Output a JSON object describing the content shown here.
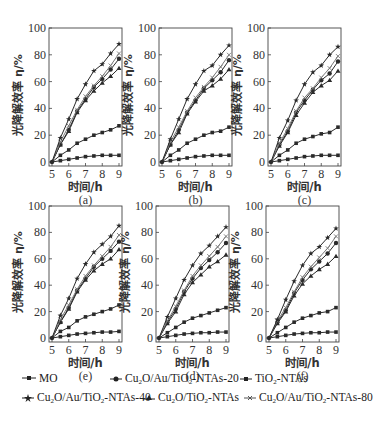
{
  "chart_data": [
    {
      "type": "line",
      "panel_label": "(a)",
      "xlabel": "时间/h",
      "ylabel": "光降解效率 η/%",
      "xlim": [
        5,
        9
      ],
      "ylim": [
        0,
        100
      ],
      "xticks": [
        5,
        6,
        7,
        8,
        9
      ],
      "yticks": [
        0,
        20,
        40,
        60,
        80,
        100
      ],
      "x": [
        5,
        5.5,
        6,
        6.5,
        7,
        7.5,
        8,
        8.5,
        9
      ],
      "series": [
        {
          "name": "MO",
          "values": [
            0,
            1,
            2,
            3,
            4,
            4.5,
            5,
            5,
            5
          ]
        },
        {
          "name": "TiO2-NTAs",
          "values": [
            0,
            5,
            9,
            14,
            17,
            20,
            22,
            24,
            27
          ]
        },
        {
          "name": "Cu2O/TiO2-NTAs",
          "values": [
            0,
            13,
            23,
            37,
            46,
            53,
            59,
            64,
            70
          ]
        },
        {
          "name": "Cu2O/Au/TiO2-NTAs-20",
          "values": [
            0,
            13,
            24,
            38,
            47,
            56,
            62,
            69,
            77
          ]
        },
        {
          "name": "Cu2O/Au/TiO2-NTAs-80",
          "values": [
            0,
            15,
            27,
            39,
            49,
            57,
            64,
            72,
            81
          ]
        },
        {
          "name": "Cu2O/Au/TiO2-NTAs-40",
          "values": [
            0,
            18,
            32,
            47,
            58,
            68,
            73,
            81,
            88
          ]
        }
      ]
    },
    {
      "type": "line",
      "panel_label": "(b)",
      "xlabel": "时间/h",
      "ylabel": "光降解效率 η/%",
      "xlim": [
        5,
        9
      ],
      "ylim": [
        0,
        100
      ],
      "xticks": [
        5,
        6,
        7,
        8,
        9
      ],
      "yticks": [
        0,
        20,
        40,
        60,
        80,
        100
      ],
      "x": [
        5,
        5.5,
        6,
        6.5,
        7,
        7.5,
        8,
        8.5,
        9
      ],
      "series": [
        {
          "name": "MO",
          "values": [
            0,
            1,
            2,
            3,
            4,
            4.5,
            5,
            5,
            5
          ]
        },
        {
          "name": "TiO2-NTAs",
          "values": [
            0,
            5,
            9,
            14,
            17,
            20,
            22,
            23,
            26
          ]
        },
        {
          "name": "Cu2O/TiO2-NTAs",
          "values": [
            0,
            13,
            22,
            36,
            45,
            53,
            57,
            62,
            69
          ]
        },
        {
          "name": "Cu2O/Au/TiO2-NTAs-20",
          "values": [
            0,
            13,
            24,
            37,
            46,
            55,
            61,
            67,
            76
          ]
        },
        {
          "name": "Cu2O/Au/TiO2-NTAs-80",
          "values": [
            0,
            15,
            26,
            38,
            48,
            56,
            63,
            71,
            80
          ]
        },
        {
          "name": "Cu2O/Au/TiO2-NTAs-40",
          "values": [
            0,
            17,
            32,
            47,
            58,
            68,
            72,
            80,
            87
          ]
        }
      ]
    },
    {
      "type": "line",
      "panel_label": "(c)",
      "xlabel": "时间/h",
      "ylabel": "光降解效率 η/%",
      "xlim": [
        5,
        9
      ],
      "ylim": [
        0,
        100
      ],
      "xticks": [
        5,
        6,
        7,
        8,
        9
      ],
      "yticks": [
        0,
        20,
        40,
        60,
        80,
        100
      ],
      "x": [
        5,
        5.5,
        6,
        6.5,
        7,
        7.5,
        8,
        8.5,
        9
      ],
      "series": [
        {
          "name": "MO",
          "values": [
            0,
            1,
            2,
            3,
            4,
            4.5,
            5,
            5,
            5
          ]
        },
        {
          "name": "TiO2-NTAs",
          "values": [
            0,
            5,
            9,
            14,
            17,
            19,
            21,
            22,
            26
          ]
        },
        {
          "name": "Cu2O/TiO2-NTAs",
          "values": [
            0,
            12,
            22,
            35,
            44,
            52,
            57,
            61,
            68
          ]
        },
        {
          "name": "Cu2O/Au/TiO2-NTAs-20",
          "values": [
            0,
            13,
            23,
            37,
            46,
            54,
            61,
            66,
            75
          ]
        },
        {
          "name": "Cu2O/Au/TiO2-NTAs-80",
          "values": [
            0,
            14,
            25,
            38,
            48,
            55,
            63,
            70,
            79
          ]
        },
        {
          "name": "Cu2O/Au/TiO2-NTAs-40",
          "values": [
            0,
            18,
            31,
            46,
            58,
            67,
            72,
            80,
            86
          ]
        }
      ]
    },
    {
      "type": "line",
      "panel_label": "(e)",
      "xlabel": "时间/h",
      "ylabel": "光降解效率 η/%",
      "xlim": [
        5,
        9
      ],
      "ylim": [
        0,
        100
      ],
      "xticks": [
        5,
        6,
        7,
        8,
        9
      ],
      "yticks": [
        0,
        20,
        40,
        60,
        80,
        100
      ],
      "x": [
        5,
        5.5,
        6,
        6.5,
        7,
        7.5,
        8,
        8.5,
        9
      ],
      "series": [
        {
          "name": "MO",
          "values": [
            0,
            1,
            2,
            3,
            3.5,
            4,
            4.5,
            4.5,
            5
          ]
        },
        {
          "name": "TiO2-NTAs",
          "values": [
            0,
            5,
            8,
            13,
            16,
            18,
            20,
            22,
            25
          ]
        },
        {
          "name": "Cu2O/TiO2-NTAs",
          "values": [
            0,
            12,
            22,
            35,
            44,
            51,
            56,
            60,
            67
          ]
        },
        {
          "name": "Cu2O/Au/TiO2-NTAs-20",
          "values": [
            0,
            12,
            23,
            36,
            45,
            54,
            60,
            66,
            73
          ]
        },
        {
          "name": "Cu2O/Au/TiO2-NTAs-80",
          "values": [
            0,
            14,
            25,
            37,
            47,
            55,
            62,
            69,
            78
          ]
        },
        {
          "name": "Cu2O/Au/TiO2-NTAs-40",
          "values": [
            0,
            17,
            30,
            45,
            56,
            65,
            71,
            77,
            85
          ]
        }
      ]
    },
    {
      "type": "line",
      "panel_label": "(d)",
      "xlabel": "时间/h",
      "ylabel": "光降解效率 η/%",
      "xlim": [
        5,
        9
      ],
      "ylim": [
        0,
        100
      ],
      "xticks": [
        5,
        6,
        7,
        8,
        9
      ],
      "yticks": [
        0,
        20,
        40,
        60,
        80,
        100
      ],
      "x": [
        5,
        5.5,
        6,
        6.5,
        7,
        7.5,
        8,
        8.5,
        9
      ],
      "series": [
        {
          "name": "MO",
          "values": [
            0,
            1,
            2,
            3,
            3.5,
            4,
            4,
            4.5,
            4.5
          ]
        },
        {
          "name": "TiO2-NTAs",
          "values": [
            0,
            4,
            8,
            12,
            15,
            17,
            19,
            21,
            23
          ]
        },
        {
          "name": "Cu2O/TiO2-NTAs",
          "values": [
            0,
            11,
            20,
            33,
            42,
            48,
            54,
            58,
            63
          ]
        },
        {
          "name": "Cu2O/Au/TiO2-NTAs-20",
          "values": [
            0,
            12,
            22,
            35,
            45,
            53,
            59,
            65,
            72
          ]
        },
        {
          "name": "Cu2O/Au/TiO2-NTAs-80",
          "values": [
            0,
            13,
            24,
            36,
            47,
            55,
            62,
            69,
            77
          ]
        },
        {
          "name": "Cu2O/Au/TiO2-NTAs-40",
          "values": [
            0,
            16,
            30,
            44,
            55,
            64,
            70,
            77,
            84
          ]
        }
      ]
    },
    {
      "type": "line",
      "panel_label": "(f)",
      "xlabel": "时间/h",
      "ylabel": "光降解效率 η/%",
      "xlim": [
        5,
        9
      ],
      "ylim": [
        0,
        100
      ],
      "xticks": [
        5,
        6,
        7,
        8,
        9
      ],
      "yticks": [
        0,
        20,
        40,
        60,
        80,
        100
      ],
      "x": [
        5,
        5.5,
        6,
        6.5,
        7,
        7.5,
        8,
        8.5,
        9
      ],
      "series": [
        {
          "name": "MO",
          "values": [
            0,
            1,
            2,
            3,
            3.5,
            4,
            4,
            4.5,
            4.5
          ]
        },
        {
          "name": "TiO2-NTAs",
          "values": [
            0,
            4,
            8,
            12,
            15,
            17,
            19,
            20,
            23
          ]
        },
        {
          "name": "Cu2O/TiO2-NTAs",
          "values": [
            0,
            11,
            20,
            32,
            41,
            47,
            52,
            56,
            62
          ]
        },
        {
          "name": "Cu2O/Au/TiO2-NTAs-20",
          "values": [
            0,
            12,
            21,
            34,
            44,
            52,
            58,
            64,
            72
          ]
        },
        {
          "name": "Cu2O/Au/TiO2-NTAs-80",
          "values": [
            0,
            13,
            23,
            35,
            46,
            54,
            61,
            68,
            77
          ]
        },
        {
          "name": "Cu2O/Au/TiO2-NTAs-40",
          "values": [
            0,
            14,
            29,
            43,
            55,
            64,
            69,
            76,
            83
          ]
        }
      ]
    }
  ],
  "panels": [
    {
      "label": "(a)",
      "x0": 49,
      "y0": 28,
      "w": 73,
      "h": 134
    },
    {
      "label": "(b)",
      "x0": 159,
      "y0": 28,
      "w": 73,
      "h": 134
    },
    {
      "label": "(c)",
      "x0": 268,
      "y0": 28,
      "w": 73,
      "h": 134
    },
    {
      "label": "(e)",
      "x0": 49,
      "y0": 206,
      "w": 73,
      "h": 132
    },
    {
      "label": "(d)",
      "x0": 156,
      "y0": 206,
      "w": 73,
      "h": 132
    },
    {
      "label": "(f)",
      "x0": 266,
      "y0": 206,
      "w": 73,
      "h": 132
    }
  ],
  "axis": {
    "xlabel": "时间/h",
    "ylabel": "光降解效率 η/%"
  },
  "legend": {
    "items": [
      {
        "key": "MO",
        "marker": "square",
        "html": "MO"
      },
      {
        "key": "Cu2O/Au/TiO2-NTAs-20",
        "marker": "circle",
        "html": "Cu<sub>2</sub>O/Au/TiO<sub>2</sub>-NTAs-20"
      },
      {
        "key": "TiO2-NTAs",
        "marker": "square",
        "html": "TiO<sub>2</sub>-NTAs"
      },
      {
        "key": "Cu2O/Au/TiO2-NTAs-40",
        "marker": "star",
        "html": "Cu<sub>2</sub>O/Au/TiO<sub>2</sub>-NTAs-40"
      },
      {
        "key": "Cu2O/TiO2-NTAs",
        "marker": "triangle",
        "html": "Cu<sub>2</sub>O/TiO<sub>2</sub>-NTAs"
      },
      {
        "key": "Cu2O/Au/TiO2-NTAs-80",
        "marker": "cross",
        "html": "Cu<sub>2</sub>O/Au/TiO<sub>2</sub>-NTAs-80"
      }
    ]
  },
  "colors": {
    "line": "#2a2a2a",
    "axis": "#444444",
    "cross_series": "#777777"
  }
}
